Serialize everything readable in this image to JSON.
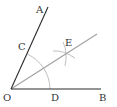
{
  "diagram": {
    "points": {
      "O": {
        "label": "O",
        "x": 11,
        "y": 89
      },
      "A": {
        "label": "A",
        "x": 48,
        "y": 7
      },
      "B": {
        "label": "B",
        "x": 101,
        "y": 89
      },
      "C": {
        "label": "C",
        "x": 27,
        "y": 54
      },
      "D": {
        "label": "D",
        "x": 50,
        "y": 89
      },
      "E": {
        "label": "E",
        "x": 65,
        "y": 53
      }
    },
    "colors": {
      "main_lines": "#2b2b2b",
      "construction": "#a8a8a8",
      "bisector": "#a0a0a0"
    }
  }
}
